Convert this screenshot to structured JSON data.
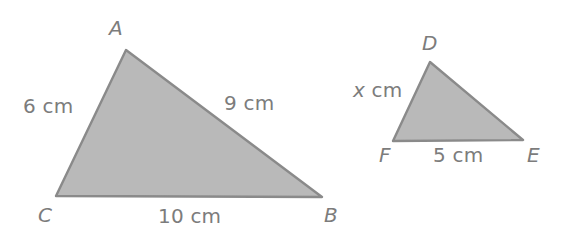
{
  "figure": {
    "background_color": "#ffffff",
    "fill_color": "#b9b9b9",
    "stroke_color": "#8a8a8a",
    "text_color": "#7c7c7c",
    "triangles": [
      {
        "name": "triangle-abc",
        "vertices": [
          {
            "label": "A",
            "x": 126,
            "y": 50
          },
          {
            "label": "B",
            "x": 322,
            "y": 197
          },
          {
            "label": "C",
            "x": 56,
            "y": 196
          }
        ],
        "sides": [
          {
            "name": "side-ca",
            "label": "6 cm",
            "value": 6,
            "unit": "cm"
          },
          {
            "name": "side-ab",
            "label": "9 cm",
            "value": 9,
            "unit": "cm"
          },
          {
            "name": "side-cb",
            "label": "10 cm",
            "value": 10,
            "unit": "cm"
          }
        ]
      },
      {
        "name": "triangle-def",
        "vertices": [
          {
            "label": "D",
            "x": 430,
            "y": 62
          },
          {
            "label": "E",
            "x": 523,
            "y": 140
          },
          {
            "label": "F",
            "x": 393,
            "y": 141
          }
        ],
        "sides": [
          {
            "name": "side-fd",
            "label_var": "x",
            "label_unit": " cm",
            "value": "x",
            "unit": "cm"
          },
          {
            "name": "side-fe",
            "label": "5 cm",
            "value": 5,
            "unit": "cm"
          }
        ]
      }
    ],
    "labels": {
      "A": "A",
      "B": "B",
      "C": "C",
      "D": "D",
      "E": "E",
      "F": "F",
      "side_6": "6 cm",
      "side_9": "9 cm",
      "side_10": "10 cm",
      "side_x_var": "x",
      "side_x_unit": " cm",
      "side_5": "5 cm"
    }
  }
}
